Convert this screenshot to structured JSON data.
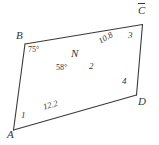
{
  "figure": {
    "background_color": "#ffffff",
    "stroke_color": "#3a3a3a",
    "text_color": "#333333",
    "vertices": {
      "A": "A",
      "B": "B",
      "C": "C",
      "D": "D",
      "N": "N"
    },
    "angle_labels": {
      "at_b": "75°",
      "at_n_left": "58°",
      "angle_1": "1",
      "angle_2": "2",
      "angle_3": "3",
      "angle_4": "4"
    },
    "segment_labels": {
      "an": "12.2",
      "nc": "10.8"
    }
  }
}
